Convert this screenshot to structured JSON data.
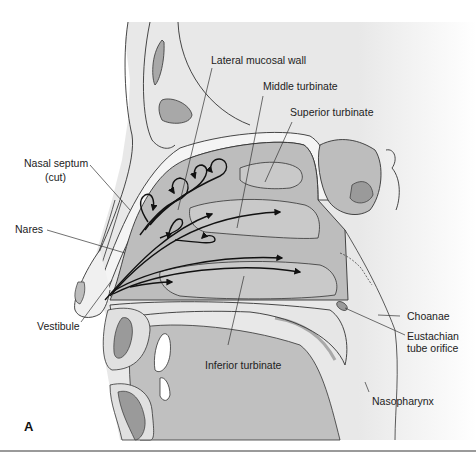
{
  "figure": {
    "panel_label": "A",
    "labels": {
      "lateral_mucosal_wall": "Lateral mucosal wall",
      "middle_turbinate": "Middle turbinate",
      "superior_turbinate": "Superior turbinate",
      "nasal_septum": "Nasal septum",
      "nasal_septum_note": "(cut)",
      "nares": "Nares",
      "vestibule": "Vestibule",
      "inferior_turbinate": "Inferior turbinate",
      "choanae": "Choanae",
      "eustachian_1": "Eustachian",
      "eustachian_2": "tube orifice",
      "nasopharynx": "Nasopharynx"
    },
    "colors": {
      "background": "#ffffff",
      "light_tissue": "#ececec",
      "cavity": "#bdbdbd",
      "turbinate": "#c9c9c9",
      "dark_tissue": "#9a9a9a",
      "sinus": "#a8a8a8",
      "outline": "#333333",
      "arrow": "#111111"
    }
  }
}
